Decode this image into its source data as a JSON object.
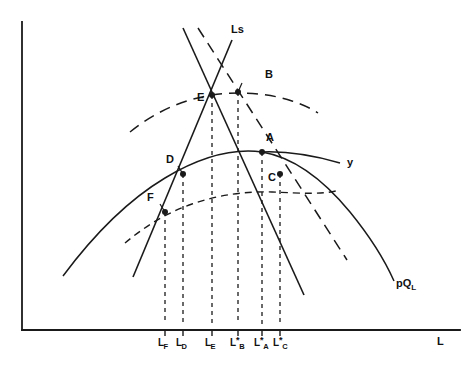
{
  "figure": {
    "type": "economics-diagram",
    "title": "",
    "axes": {
      "x_label": "L",
      "y_label": "",
      "x_axis": {
        "x1": 22,
        "y1": 330,
        "x2": 460,
        "y2": 330
      },
      "y_axis": {
        "x1": 22,
        "y1": 22,
        "x2": 22,
        "y2": 330
      }
    },
    "curve_labels": [
      {
        "id": "ls",
        "text": "Ls",
        "x": 231,
        "y": 30
      },
      {
        "id": "y",
        "text": "y",
        "x": 347,
        "y": 158
      },
      {
        "id": "pql",
        "text": "pQ",
        "sub": "L",
        "x": 398,
        "y": 279
      }
    ],
    "points": [
      {
        "id": "A",
        "label": "A",
        "x": 262,
        "y": 152,
        "label_x": 265,
        "label_y": 138
      },
      {
        "id": "B",
        "label": "B",
        "x": 238,
        "y": 92,
        "label_x": 241,
        "label_y": 76
      },
      {
        "id": "C",
        "label": "C",
        "x": 280,
        "y": 174,
        "label_x": 272,
        "label_y": 177
      },
      {
        "id": "D",
        "label": "D",
        "x": 183,
        "y": 174,
        "label_x": 168,
        "label_y": 159
      },
      {
        "id": "E",
        "label": "E",
        "x": 212,
        "y": 95,
        "label_x": 198,
        "label_y": 96
      },
      {
        "id": "F",
        "label": "F",
        "x": 165,
        "y": 212,
        "label_x": 150,
        "label_y": 197
      }
    ],
    "x_ticks": [
      {
        "id": "LF",
        "base": "L",
        "sub": "F",
        "star": false,
        "x": 165,
        "label_y": 338
      },
      {
        "id": "LD",
        "base": "L",
        "sub": "D",
        "star": false,
        "x": 183,
        "label_y": 338
      },
      {
        "id": "LE",
        "base": "L",
        "sub": "E",
        "star": false,
        "x": 212,
        "label_y": 338
      },
      {
        "id": "LBs",
        "base": "L",
        "sub": "B",
        "star": true,
        "x": 238,
        "label_y": 338
      },
      {
        "id": "LAs",
        "base": "L",
        "sub": "A",
        "star": true,
        "x": 262,
        "label_y": 338
      },
      {
        "id": "LCs",
        "base": "L",
        "sub": "C",
        "star": true,
        "x": 280,
        "label_y": 338
      }
    ],
    "colors": {
      "ink": "#1a1a1a",
      "background": "#ffffff"
    }
  }
}
